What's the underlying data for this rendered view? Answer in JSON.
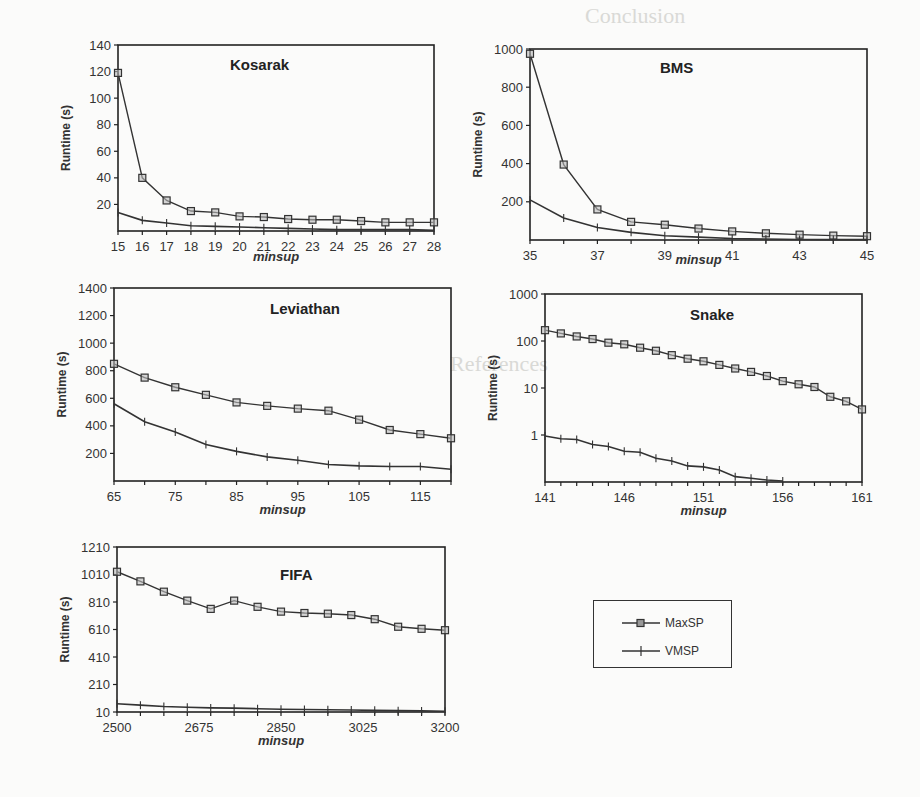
{
  "chart_data": [
    {
      "type": "line",
      "title": "Kosarak",
      "xlabel": "minsup",
      "ylabel": "Runtime (s)",
      "x": [
        15,
        16,
        17,
        18,
        19,
        20,
        21,
        22,
        23,
        24,
        25,
        26,
        27,
        28
      ],
      "ylim": [
        0,
        140
      ],
      "yticks": [
        20,
        40,
        60,
        80,
        100,
        120,
        140
      ],
      "series": [
        {
          "name": "MaxSP",
          "marker": "square",
          "values": [
            119,
            40,
            23,
            15,
            14,
            11,
            10.5,
            9,
            8.5,
            8.5,
            7.5,
            6.5,
            6.5,
            6.5
          ]
        },
        {
          "name": "VMSP",
          "marker": "plus",
          "values": [
            14,
            8,
            6,
            4,
            3.5,
            3,
            2.5,
            2,
            1.5,
            1,
            1,
            1,
            1,
            0.5
          ]
        }
      ],
      "grid": false
    },
    {
      "type": "line",
      "title": "BMS",
      "xlabel": "minsup",
      "ylabel": "Runtime (s)",
      "x": [
        35,
        36,
        37,
        38,
        39,
        40,
        41,
        42,
        43,
        44,
        45
      ],
      "xticks": [
        35,
        37,
        39,
        41,
        43,
        45
      ],
      "ylim": [
        0,
        1000
      ],
      "yticks": [
        200,
        400,
        600,
        800,
        1000
      ],
      "series": [
        {
          "name": "MaxSP",
          "marker": "square",
          "values": [
            975,
            395,
            160,
            95,
            80,
            60,
            45,
            35,
            28,
            23,
            20
          ]
        },
        {
          "name": "VMSP",
          "marker": "plus",
          "values": [
            210,
            115,
            65,
            40,
            22,
            15,
            8,
            5,
            3,
            2,
            2
          ]
        }
      ],
      "grid": false
    },
    {
      "type": "line",
      "title": "Leviathan",
      "xlabel": "minsup",
      "ylabel": "Runtime (s)",
      "x": [
        65,
        70,
        75,
        80,
        85,
        90,
        95,
        100,
        105,
        110,
        115,
        120
      ],
      "xticks": [
        65,
        75,
        85,
        95,
        105,
        115
      ],
      "ylim": [
        0,
        1400
      ],
      "yticks": [
        200,
        400,
        600,
        800,
        1000,
        1200,
        1400
      ],
      "series": [
        {
          "name": "MaxSP",
          "marker": "square",
          "values": [
            850,
            750,
            680,
            625,
            570,
            545,
            525,
            510,
            445,
            370,
            340,
            310
          ]
        },
        {
          "name": "VMSP",
          "marker": "plus",
          "values": [
            560,
            430,
            355,
            265,
            215,
            175,
            150,
            120,
            110,
            105,
            105,
            85
          ]
        }
      ],
      "grid": false
    },
    {
      "type": "line",
      "title": "Snake",
      "xlabel": "minsup",
      "ylabel": "Runtime (s)",
      "yscale": "log",
      "x": [
        141,
        142,
        143,
        144,
        145,
        146,
        147,
        148,
        149,
        150,
        151,
        152,
        153,
        154,
        155,
        156,
        157,
        158,
        159,
        160,
        161
      ],
      "xticks": [
        141,
        146,
        151,
        156,
        161
      ],
      "ylim": [
        0.1,
        1000
      ],
      "yticks": [
        1,
        10,
        100,
        1000
      ],
      "series": [
        {
          "name": "MaxSP",
          "marker": "square",
          "values": [
            170,
            145,
            125,
            110,
            92,
            85,
            72,
            62,
            50,
            42,
            37,
            31,
            26,
            22,
            18,
            14,
            12,
            10.5,
            6.5,
            5.2,
            3.5
          ]
        },
        {
          "name": "VMSP",
          "marker": "plus",
          "values": [
            0.95,
            0.83,
            0.8,
            0.63,
            0.57,
            0.45,
            0.43,
            0.32,
            0.28,
            0.22,
            0.21,
            0.18,
            0.13,
            0.12,
            0.11,
            0.105
          ]
        }
      ],
      "grid": false
    },
    {
      "type": "line",
      "title": "FIFA",
      "xlabel": "minsup",
      "ylabel": "Runtime (s)",
      "x": [
        2500,
        2550,
        2600,
        2650,
        2700,
        2750,
        2800,
        2850,
        2900,
        2950,
        3000,
        3050,
        3100,
        3150,
        3200
      ],
      "xticks": [
        2500,
        2675,
        2850,
        3025,
        3200
      ],
      "ylim": [
        10,
        1210
      ],
      "yticks": [
        10,
        210,
        410,
        610,
        810,
        1010,
        1210
      ],
      "series": [
        {
          "name": "MaxSP",
          "marker": "square",
          "values": [
            1030,
            960,
            885,
            820,
            760,
            820,
            775,
            740,
            730,
            725,
            715,
            685,
            630,
            615,
            605
          ]
        },
        {
          "name": "VMSP",
          "marker": "plus",
          "values": [
            70,
            60,
            50,
            45,
            40,
            38,
            34,
            30,
            28,
            26,
            24,
            22,
            20,
            18,
            16
          ]
        }
      ],
      "grid": false
    }
  ],
  "legend": {
    "items": [
      {
        "label": "MaxSP",
        "marker": "square"
      },
      {
        "label": "VMSP",
        "marker": "plus"
      }
    ]
  },
  "colors": {
    "line": "#333333",
    "axis": "#222222",
    "background": "#fbfbfa",
    "ghost_text": "#d9d9d6"
  },
  "background_text": {
    "heading_1": "Conclusion",
    "heading_2": "References"
  }
}
